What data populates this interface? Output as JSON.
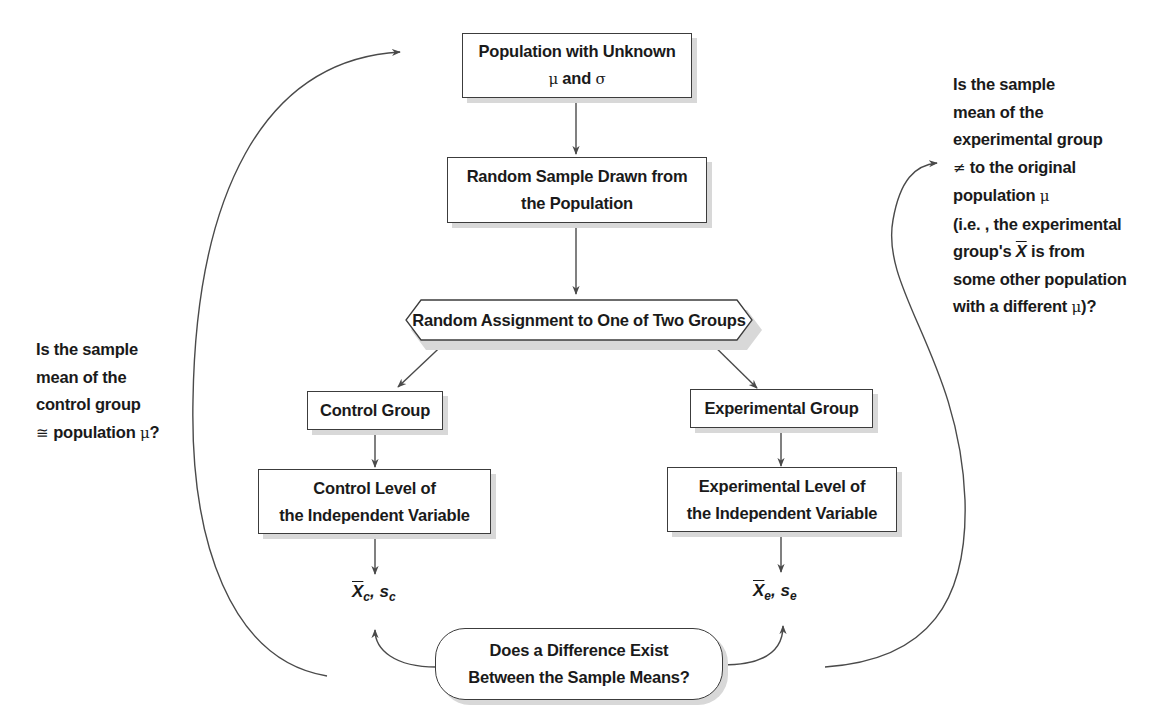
{
  "diagram": {
    "population_box": {
      "line1": "Population with Unknown",
      "mu": "μ",
      "and": " and ",
      "sigma": "σ"
    },
    "sample_box": {
      "line1": "Random Sample Drawn from",
      "line2": "the Population"
    },
    "assignment_box": {
      "label": "Random Assignment to One of Two Groups"
    },
    "control_group_box": {
      "label": "Control Group"
    },
    "experimental_group_box": {
      "label": "Experimental Group"
    },
    "control_level_box": {
      "line1": "Control Level of",
      "line2": "the Independent Variable"
    },
    "experimental_level_box": {
      "line1": "Experimental Level of",
      "line2": "the Independent Variable"
    },
    "control_stats": {
      "mean": "X",
      "mean_sub": "c",
      "sep": ", ",
      "sd": "s",
      "sd_sub": "c"
    },
    "experimental_stats": {
      "mean": "X",
      "mean_sub": "e",
      "sep": ", ",
      "sd": "s",
      "sd_sub": "e"
    },
    "difference_box": {
      "line1": "Does a Difference Exist",
      "line2": "Between the Sample Means?"
    },
    "left_note": {
      "lines": [
        "Is the sample",
        "mean of the",
        "control group"
      ],
      "last_symbol": "≅",
      "last_text": " population ",
      "last_mu": "μ",
      "last_end": "?"
    },
    "right_note": {
      "line1": "Is the sample",
      "line2": "mean of the",
      "line3": "experimental group",
      "line4_symbol": "≠",
      "line4_text": " to the original",
      "line5_text": "population ",
      "line5_mu": "μ",
      "line6": "(i.e. , the experimental",
      "line7_pre": "group's ",
      "line7_x": "X",
      "line7_post": " is from",
      "line8": "some other population",
      "line9_pre": "with a different ",
      "line9_mu": "μ",
      "line9_post": ")?"
    },
    "colors": {
      "line": "#4a4a4a",
      "shadow": "#d8d8d8",
      "text": "#1a1a1a"
    }
  }
}
